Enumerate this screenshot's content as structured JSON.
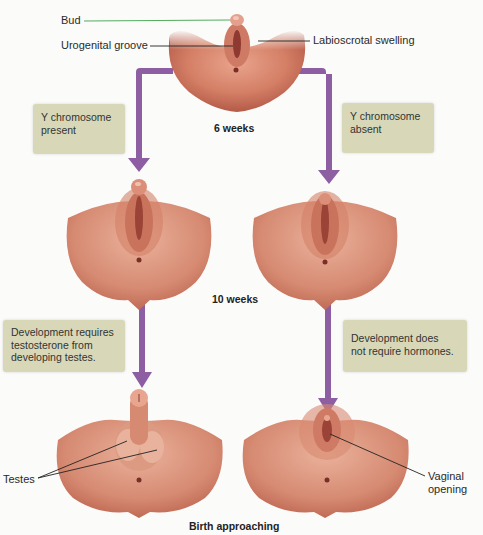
{
  "stages": {
    "stage1": "6 weeks",
    "stage2": "10 weeks",
    "stage3": "Birth approaching"
  },
  "labels": {
    "bud": "Bud",
    "urogenital_groove": "Urogenital groove",
    "labioscrotal_swelling": "Labioscrotal  swelling",
    "testes": "Testes",
    "vaginal_opening_line1": "Vaginal",
    "vaginal_opening_line2": "opening"
  },
  "boxes": {
    "y_present_line1": "Y chromosome",
    "y_present_line2": "present",
    "y_absent_line1": "Y chromosome",
    "y_absent_line2": "absent",
    "male_dev_line1": "Development requires",
    "male_dev_line2": "testosterone from",
    "male_dev_line3": "developing testes.",
    "female_dev_line1": "Development does",
    "female_dev_line2": "not require hormones."
  },
  "colors": {
    "arrow": "#8e5ea3",
    "box": "#d8d8b8",
    "skin": "#d9826a",
    "skin_dark": "#b45a48",
    "bud_line": "#3fa34d"
  }
}
